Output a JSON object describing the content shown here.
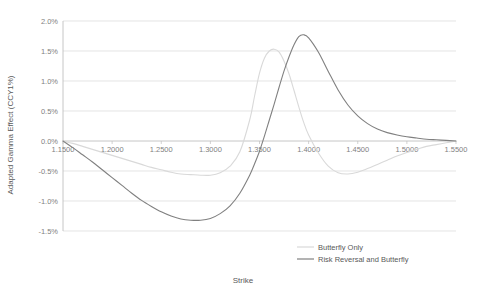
{
  "chart_data": {
    "type": "line",
    "title": "",
    "xlabel": "Strike",
    "ylabel": "Adapted Gamma Effect (CCY1%)",
    "xlim": [
      1.15,
      1.55
    ],
    "ylim": [
      -0.015,
      0.02
    ],
    "grid": true,
    "legend_position": "inside-bottom-right",
    "xticks": [
      1.15,
      1.2,
      1.25,
      1.3,
      1.35,
      1.4,
      1.45,
      1.5,
      1.55
    ],
    "xtick_labels": [
      "1.1500",
      "1.2000",
      "1.2500",
      "1.3000",
      "1.3500",
      "1.4000",
      "1.4500",
      "1.5000",
      "1.5500"
    ],
    "yticks": [
      0.02,
      0.015,
      0.01,
      0.005,
      0.0,
      -0.005,
      -0.01,
      -0.015
    ],
    "ytick_labels": [
      "2.0%",
      "1.5%",
      "1.0%",
      "0.5%",
      "0.0%",
      "-0.5%",
      "-1.0%",
      "-1.5%"
    ],
    "x": [
      1.15,
      1.16,
      1.17,
      1.18,
      1.19,
      1.2,
      1.21,
      1.22,
      1.23,
      1.24,
      1.25,
      1.26,
      1.27,
      1.28,
      1.29,
      1.3,
      1.31,
      1.32,
      1.33,
      1.34,
      1.345,
      1.35,
      1.355,
      1.36,
      1.365,
      1.37,
      1.375,
      1.38,
      1.385,
      1.39,
      1.395,
      1.4,
      1.41,
      1.42,
      1.43,
      1.44,
      1.45,
      1.46,
      1.47,
      1.48,
      1.49,
      1.5,
      1.51,
      1.52,
      1.53,
      1.54,
      1.55
    ],
    "series": [
      {
        "name": "Butterfly Only",
        "color": "#d9d9d9",
        "values": [
          0.0,
          -0.0004,
          -0.0009,
          -0.0014,
          -0.0019,
          -0.0024,
          -0.0029,
          -0.0034,
          -0.0039,
          -0.0044,
          -0.0048,
          -0.0052,
          -0.0055,
          -0.0056,
          -0.0057,
          -0.0057,
          -0.0053,
          -0.0042,
          -0.0018,
          0.0035,
          0.0075,
          0.0113,
          0.0138,
          0.015,
          0.0153,
          0.0148,
          0.0133,
          0.0112,
          0.0085,
          0.0057,
          0.0031,
          0.001,
          -0.002,
          -0.0042,
          -0.0053,
          -0.0055,
          -0.0052,
          -0.0046,
          -0.0039,
          -0.0032,
          -0.0025,
          -0.0019,
          -0.0014,
          -0.0009,
          -0.0006,
          -0.0003,
          0.0
        ]
      },
      {
        "name": "Risk Reversal and Butterfly",
        "color": "#808080",
        "values": [
          0.0,
          -0.0011,
          -0.0023,
          -0.0035,
          -0.0048,
          -0.0061,
          -0.0074,
          -0.0087,
          -0.0099,
          -0.0109,
          -0.0118,
          -0.0125,
          -0.013,
          -0.0132,
          -0.0132,
          -0.0129,
          -0.0121,
          -0.0108,
          -0.0087,
          -0.0057,
          -0.0038,
          -0.0017,
          0.0008,
          0.0035,
          0.0062,
          0.009,
          0.0117,
          0.014,
          0.016,
          0.0174,
          0.0177,
          0.0172,
          0.0148,
          0.0116,
          0.0085,
          0.006,
          0.0042,
          0.0029,
          0.002,
          0.0014,
          0.001,
          0.0007,
          0.0005,
          0.0003,
          0.0002,
          0.0001,
          0.0
        ]
      }
    ]
  },
  "axes": {
    "y_title": "Adapted Gamma Effect (CCY1%)",
    "x_title": "Strike"
  },
  "legend": {
    "items": [
      {
        "label": "Butterfly Only",
        "color": "#d9d9d9"
      },
      {
        "label": "Risk Reversal and Butterfly",
        "color": "#808080"
      }
    ]
  }
}
